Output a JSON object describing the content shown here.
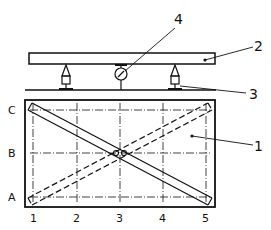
{
  "diagram": {
    "callouts": {
      "part1": "1",
      "part2": "2",
      "part3": "3",
      "part4": "4"
    },
    "row_labels": [
      "C",
      "B",
      "A"
    ],
    "column_labels": [
      "1",
      "2",
      "3",
      "4",
      "5"
    ],
    "colors": {
      "ink": "#111111",
      "background": "#ffffff"
    }
  }
}
